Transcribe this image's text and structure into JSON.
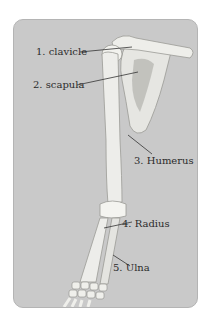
{
  "figure": {
    "labels": [
      {
        "id": "clavicle",
        "text": "1. clavicle"
      },
      {
        "id": "scapula",
        "text": "2. scapula"
      },
      {
        "id": "humerus",
        "text": "3. Humerus"
      },
      {
        "id": "radius",
        "text": "4. Radius"
      },
      {
        "id": "ulna",
        "text": "5. Ulna"
      }
    ],
    "colors": {
      "background": "#c9c9c9",
      "bone": "#ededea",
      "bone_shadow": "#b8b8b3",
      "leader_line": "#333333"
    }
  }
}
